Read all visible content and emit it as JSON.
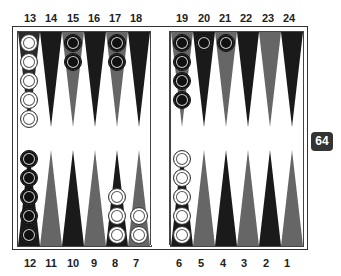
{
  "top_labels": [
    "13",
    "14",
    "15",
    "16",
    "17",
    "18",
    "19",
    "20",
    "21",
    "22",
    "23",
    "24"
  ],
  "bottom_labels": [
    "12",
    "11",
    "10",
    "9",
    "8",
    "7",
    "6",
    "5",
    "4",
    "3",
    "2",
    "1"
  ],
  "doubling_cube": {
    "value": "64"
  },
  "colors": {
    "dark_point": "#1a1a1a",
    "light_point": "#555555",
    "board": "#ffffff",
    "frame": "#333333"
  },
  "checkers": {
    "13": {
      "color": "white",
      "count": 5
    },
    "15": {
      "color": "black",
      "count": 2
    },
    "17": {
      "color": "black",
      "count": 2
    },
    "19": {
      "color": "black",
      "count": 4
    },
    "20": {
      "color": "black",
      "count": 1
    },
    "21": {
      "color": "black",
      "count": 1
    },
    "12": {
      "color": "black",
      "count": 5
    },
    "8": {
      "color": "white",
      "count": 3
    },
    "7": {
      "color": "white",
      "count": 2
    },
    "6": {
      "color": "white",
      "count": 5
    }
  }
}
